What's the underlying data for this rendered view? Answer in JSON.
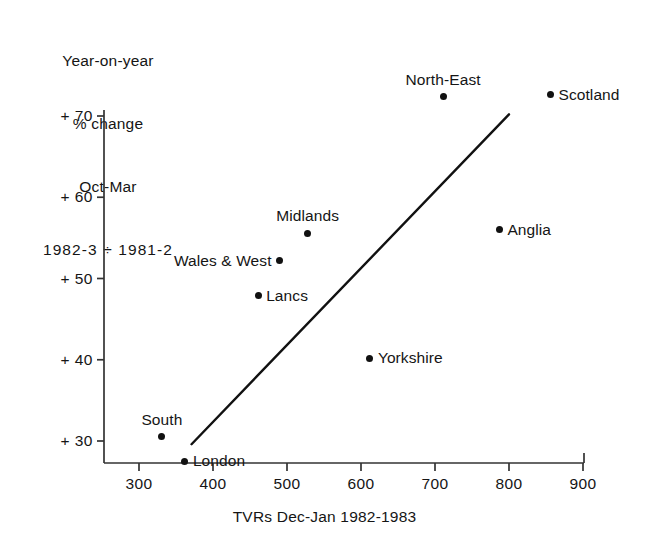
{
  "chart_data": {
    "type": "scatter",
    "title": "",
    "ylabel_lines": [
      "Year-on-year",
      "% change",
      "Oct-Mar",
      "1982-3 ÷ 1981-2"
    ],
    "xlabel": "TVRs Dec-Jan 1982-1983",
    "xlim": [
      250,
      905
    ],
    "ylim": [
      26,
      76
    ],
    "xticks": [
      300,
      400,
      500,
      600,
      700,
      800,
      900
    ],
    "xtick_labels": [
      "300",
      "400",
      "500",
      "600",
      "700",
      "800",
      "900"
    ],
    "yticks": [
      30,
      40,
      50,
      60,
      70
    ],
    "ytick_labels": [
      "+ 30",
      "+ 40",
      "+ 50",
      "+ 60",
      "+ 70"
    ],
    "grid": false,
    "legend": "none",
    "points": [
      {
        "label": "South",
        "x": 331,
        "y": 30.5,
        "label_pos": "above"
      },
      {
        "label": "London",
        "x": 362,
        "y": 27.5,
        "label_pos": "right"
      },
      {
        "label": "Yorkshire",
        "x": 612,
        "y": 40.2,
        "label_pos": "right"
      },
      {
        "label": "Lancs",
        "x": 461,
        "y": 47.9,
        "label_pos": "right"
      },
      {
        "label": "Wales & West",
        "x": 490,
        "y": 52.2,
        "label_pos": "left"
      },
      {
        "label": "Midlands",
        "x": 528,
        "y": 55.6,
        "label_pos": "above"
      },
      {
        "label": "Anglia",
        "x": 787,
        "y": 56.0,
        "label_pos": "right"
      },
      {
        "label": "North-East",
        "x": 711,
        "y": 72.4,
        "label_pos": "above"
      },
      {
        "label": "Scotland",
        "x": 856,
        "y": 72.6,
        "label_pos": "right"
      }
    ],
    "trend_line": {
      "x0": 371,
      "y0": 29.6,
      "x1": 800,
      "y1": 70.2,
      "color": "#111111"
    },
    "axis_color": "#333333"
  }
}
